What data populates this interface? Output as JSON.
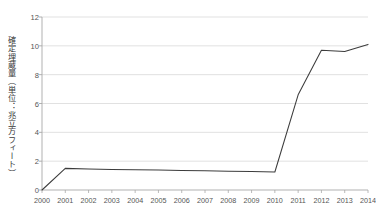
{
  "chart_data": {
    "type": "line",
    "title": "",
    "subtitle": "",
    "xlabel": "",
    "ylabel": "確定埋蔵量（単位：兆立方フィート）",
    "categories": [
      "2000",
      "2001",
      "2002",
      "2003",
      "2004",
      "2005",
      "2006",
      "2007",
      "2008",
      "2009",
      "2010",
      "2011",
      "2012",
      "2013",
      "2014"
    ],
    "x": [
      2000,
      2001,
      2002,
      2003,
      2004,
      2005,
      2006,
      2007,
      2008,
      2009,
      2010,
      2011,
      2012,
      2013,
      2014
    ],
    "values": [
      0,
      1.5,
      1.45,
      1.42,
      1.4,
      1.38,
      1.35,
      1.33,
      1.3,
      1.28,
      1.25,
      6.6,
      9.7,
      9.6,
      10.1
    ],
    "series": [
      {
        "name": "確定埋蔵量",
        "values": [
          0,
          1.5,
          1.45,
          1.42,
          1.4,
          1.38,
          1.35,
          1.33,
          1.3,
          1.28,
          1.25,
          6.6,
          9.7,
          9.6,
          10.1
        ]
      }
    ],
    "ylim": [
      0,
      12
    ],
    "yticks": [
      0,
      2,
      4,
      6,
      8,
      10,
      12
    ],
    "ytick_labels": [
      "0",
      "2",
      "4",
      "6",
      "8",
      "10",
      "12"
    ],
    "xlim": [
      2000,
      2014
    ],
    "grid": "horizontal",
    "legend": "none",
    "annotations": [],
    "colors": {
      "line": "#3c3c3c",
      "grid": "#d9d9d9",
      "axis": "#a8a8a8",
      "text": "#555555",
      "background": "#ffffff"
    }
  }
}
